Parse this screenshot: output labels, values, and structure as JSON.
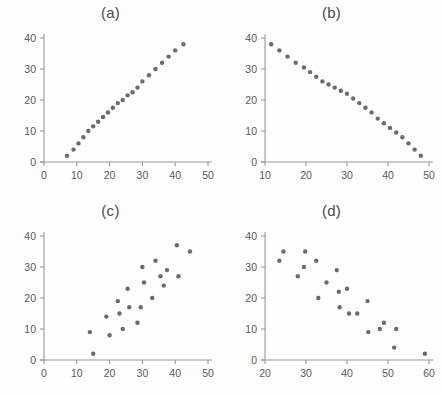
{
  "figure": {
    "background_color": "#fdfdfd",
    "marker_color": "#6b6b6b",
    "axis_color": "#9a9a9a",
    "text_color": "#4a4a4a"
  },
  "panels": [
    {
      "id": "panel-a",
      "label": "(a)"
    },
    {
      "id": "panel-b",
      "label": "(b)"
    },
    {
      "id": "panel-c",
      "label": "(c)"
    },
    {
      "id": "panel-d",
      "label": "(d)"
    }
  ],
  "chart_data": [
    {
      "type": "scatter",
      "title": "(a)",
      "xlabel": "",
      "ylabel": "",
      "xlim": [
        0,
        50
      ],
      "ylim": [
        0,
        40
      ],
      "xticks": [
        0,
        10,
        20,
        30,
        40,
        50
      ],
      "yticks": [
        0,
        10,
        20,
        30,
        40
      ],
      "grid": false,
      "legend": "none",
      "marker_color": "#6b6b6b",
      "description": "perfect positive linear relationship",
      "points": [
        [
          7,
          2
        ],
        [
          9,
          4
        ],
        [
          10.5,
          6
        ],
        [
          12,
          8
        ],
        [
          13.5,
          10
        ],
        [
          15,
          11.5
        ],
        [
          16.5,
          13
        ],
        [
          18,
          14.5
        ],
        [
          19.5,
          16
        ],
        [
          21,
          17.5
        ],
        [
          22.5,
          19
        ],
        [
          24,
          20
        ],
        [
          25.5,
          21.5
        ],
        [
          27,
          22.5
        ],
        [
          28.5,
          24
        ],
        [
          30,
          26
        ],
        [
          32,
          28
        ],
        [
          34,
          30
        ],
        [
          36,
          32
        ],
        [
          38,
          34
        ],
        [
          40,
          36
        ],
        [
          42.5,
          38
        ]
      ]
    },
    {
      "type": "scatter",
      "title": "(b)",
      "xlabel": "",
      "ylabel": "",
      "xlim": [
        10,
        50
      ],
      "ylim": [
        0,
        40
      ],
      "xticks": [
        10,
        20,
        30,
        40,
        50
      ],
      "yticks": [
        0,
        10,
        20,
        30,
        40
      ],
      "grid": false,
      "legend": "none",
      "marker_color": "#6b6b6b",
      "description": "perfect negative linear relationship",
      "points": [
        [
          11.5,
          38
        ],
        [
          13.5,
          36
        ],
        [
          15.5,
          34
        ],
        [
          17.5,
          32
        ],
        [
          19.5,
          30.5
        ],
        [
          21,
          29
        ],
        [
          22.5,
          27.5
        ],
        [
          24,
          26
        ],
        [
          25.5,
          25
        ],
        [
          27,
          24
        ],
        [
          28.5,
          23
        ],
        [
          30,
          22
        ],
        [
          31.5,
          20.5
        ],
        [
          33,
          19
        ],
        [
          34.5,
          17.5
        ],
        [
          36,
          16
        ],
        [
          37.5,
          14
        ],
        [
          39,
          12.5
        ],
        [
          40.5,
          11
        ],
        [
          42,
          9.5
        ],
        [
          43.5,
          8
        ],
        [
          45,
          6
        ],
        [
          46.5,
          4
        ],
        [
          48,
          2
        ]
      ]
    },
    {
      "type": "scatter",
      "title": "(c)",
      "xlabel": "",
      "ylabel": "",
      "xlim": [
        0,
        50
      ],
      "ylim": [
        0,
        40
      ],
      "xticks": [
        0,
        10,
        20,
        30,
        40,
        50
      ],
      "yticks": [
        0,
        10,
        20,
        30,
        40
      ],
      "grid": false,
      "legend": "none",
      "marker_color": "#6b6b6b",
      "description": "strong positive correlation with scatter",
      "points": [
        [
          14,
          9
        ],
        [
          15,
          2
        ],
        [
          19,
          14
        ],
        [
          20,
          8
        ],
        [
          22.5,
          19
        ],
        [
          23,
          15
        ],
        [
          24,
          10
        ],
        [
          25.5,
          23
        ],
        [
          26,
          17
        ],
        [
          28.5,
          12
        ],
        [
          29.5,
          17
        ],
        [
          30,
          30
        ],
        [
          30.5,
          25
        ],
        [
          33,
          20
        ],
        [
          34,
          32
        ],
        [
          35.5,
          27
        ],
        [
          36.5,
          24
        ],
        [
          37.5,
          29
        ],
        [
          40.5,
          37
        ],
        [
          41,
          27
        ],
        [
          44.5,
          35
        ]
      ]
    },
    {
      "type": "scatter",
      "title": "(d)",
      "xlabel": "",
      "ylabel": "",
      "xlim": [
        20,
        60
      ],
      "ylim": [
        0,
        40
      ],
      "xticks": [
        20,
        30,
        40,
        50,
        60
      ],
      "yticks": [
        0,
        10,
        20,
        30,
        40
      ],
      "grid": false,
      "legend": "none",
      "marker_color": "#6b6b6b",
      "description": "strong negative correlation with scatter",
      "points": [
        [
          23.5,
          32
        ],
        [
          24.5,
          35
        ],
        [
          28,
          27
        ],
        [
          29.5,
          30
        ],
        [
          29.8,
          35
        ],
        [
          32.5,
          32
        ],
        [
          33,
          20
        ],
        [
          35,
          25
        ],
        [
          37.5,
          29
        ],
        [
          38,
          22
        ],
        [
          38.2,
          17
        ],
        [
          40,
          23
        ],
        [
          40.5,
          15
        ],
        [
          42.5,
          15
        ],
        [
          45,
          19
        ],
        [
          45.2,
          9
        ],
        [
          48,
          10
        ],
        [
          49,
          12
        ],
        [
          51.5,
          4
        ],
        [
          52,
          10
        ],
        [
          59,
          2
        ]
      ]
    }
  ]
}
